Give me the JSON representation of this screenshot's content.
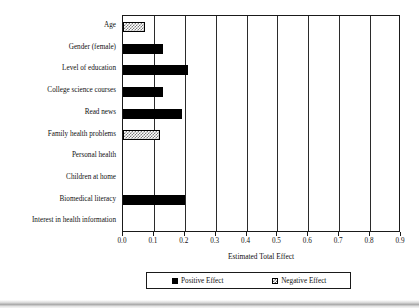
{
  "chart_data": {
    "type": "bar",
    "orientation": "horizontal",
    "title": "",
    "xlabel": "Estimated Total Effect",
    "ylabel": "",
    "xlim": [
      0.0,
      0.9
    ],
    "xticks": [
      "0.0",
      "0.1",
      "0.2",
      "0.3",
      "0.4",
      "0.5",
      "0.6",
      "0.7",
      "0.8",
      "0.9"
    ],
    "xtick_values": [
      0.0,
      0.1,
      0.2,
      0.3,
      0.4,
      0.5,
      0.6,
      0.7,
      0.8,
      0.9
    ],
    "grid": "vertical",
    "legend_position": "bottom",
    "categories": [
      "Age",
      "Gender (female)",
      "Level of education",
      "College science courses",
      "Read news",
      "Family health problems",
      "Personal health",
      "Children at home",
      "Biomedical literacy",
      "Interest in health information"
    ],
    "values": [
      0.07,
      0.13,
      0.21,
      0.13,
      0.19,
      0.12,
      0.0,
      0.0,
      0.2,
      0.0
    ],
    "effects": [
      "negative",
      "positive",
      "positive",
      "positive",
      "positive",
      "negative",
      "none",
      "none",
      "positive",
      "none"
    ],
    "bars": [
      {
        "label": "Age",
        "value": 0.07,
        "effect": "negative"
      },
      {
        "label": "Gender (female)",
        "value": 0.13,
        "effect": "positive"
      },
      {
        "label": "Level of education",
        "value": 0.21,
        "effect": "positive"
      },
      {
        "label": "College science courses",
        "value": 0.13,
        "effect": "positive"
      },
      {
        "label": "Read news",
        "value": 0.19,
        "effect": "positive"
      },
      {
        "label": "Family health problems",
        "value": 0.12,
        "effect": "negative"
      },
      {
        "label": "Personal health",
        "value": 0.0,
        "effect": "none"
      },
      {
        "label": "Children at home",
        "value": 0.0,
        "effect": "none"
      },
      {
        "label": "Biomedical literacy",
        "value": 0.2,
        "effect": "positive"
      },
      {
        "label": "Interest in health information",
        "value": 0.0,
        "effect": "none"
      }
    ],
    "legend": [
      {
        "label": "Positive Effect",
        "effect": "positive",
        "color": "#000000"
      },
      {
        "label": "Negative Effect",
        "effect": "negative",
        "color": "#7d7d7d"
      }
    ]
  }
}
